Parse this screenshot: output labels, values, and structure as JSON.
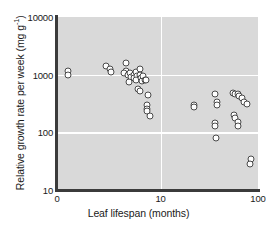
{
  "chart_data": {
    "type": "scatter",
    "title": "",
    "xlabel": "Leaf lifespan (months)",
    "ylabel_text": "Relative growth rate per week (mg g",
    "ylabel_sup": "-1",
    "ylabel_tail": ")",
    "ylabel_full": "Relative growth rate per week (mg g^-1)",
    "xscale": "log-like",
    "yscale": "log",
    "xlim": [
      0,
      100
    ],
    "ylim": [
      10,
      10000
    ],
    "xticks": [
      0,
      10,
      100
    ],
    "xtick_labels": [
      "0",
      "10",
      "100"
    ],
    "yticks": [
      10,
      100,
      1000,
      10000
    ],
    "ytick_labels": [
      "10",
      "100",
      "1000",
      "10000"
    ],
    "grid": true,
    "grid_color": "#ffffff",
    "plot_background": "#d9d9d9",
    "marker_style": "open-circle",
    "marker_edge_color": "#4a4a4a",
    "legend": null,
    "points": [
      {
        "x": 0.3,
        "y": 1150
      },
      {
        "x": 0.3,
        "y": 1000
      },
      {
        "x": 2.1,
        "y": 1400
      },
      {
        "x": 2.4,
        "y": 1250
      },
      {
        "x": 2.5,
        "y": 1100
      },
      {
        "x": 3.9,
        "y": 1600
      },
      {
        "x": 4.0,
        "y": 1150
      },
      {
        "x": 3.7,
        "y": 1050
      },
      {
        "x": 4.2,
        "y": 980
      },
      {
        "x": 4.4,
        "y": 1080
      },
      {
        "x": 4.6,
        "y": 900
      },
      {
        "x": 4.3,
        "y": 760
      },
      {
        "x": 4.9,
        "y": 1000
      },
      {
        "x": 5.2,
        "y": 1120
      },
      {
        "x": 5.0,
        "y": 880
      },
      {
        "x": 5.4,
        "y": 960
      },
      {
        "x": 5.3,
        "y": 820
      },
      {
        "x": 5.8,
        "y": 1250
      },
      {
        "x": 5.9,
        "y": 1000
      },
      {
        "x": 6.0,
        "y": 870
      },
      {
        "x": 6.2,
        "y": 780
      },
      {
        "x": 6.4,
        "y": 950
      },
      {
        "x": 6.6,
        "y": 820
      },
      {
        "x": 6.9,
        "y": 800
      },
      {
        "x": 5.6,
        "y": 560
      },
      {
        "x": 5.9,
        "y": 520
      },
      {
        "x": 7.3,
        "y": 450
      },
      {
        "x": 7.1,
        "y": 300
      },
      {
        "x": 7.0,
        "y": 250
      },
      {
        "x": 7.1,
        "y": 230
      },
      {
        "x": 7.6,
        "y": 190
      },
      {
        "x": 22,
        "y": 300
      },
      {
        "x": 22,
        "y": 270
      },
      {
        "x": 36,
        "y": 470
      },
      {
        "x": 38,
        "y": 330
      },
      {
        "x": 38,
        "y": 300
      },
      {
        "x": 36,
        "y": 145
      },
      {
        "x": 36,
        "y": 130
      },
      {
        "x": 37,
        "y": 80
      },
      {
        "x": 56,
        "y": 480
      },
      {
        "x": 58,
        "y": 460
      },
      {
        "x": 62,
        "y": 470
      },
      {
        "x": 64,
        "y": 430
      },
      {
        "x": 68,
        "y": 390
      },
      {
        "x": 72,
        "y": 330
      },
      {
        "x": 78,
        "y": 310
      },
      {
        "x": 57,
        "y": 200
      },
      {
        "x": 58,
        "y": 175
      },
      {
        "x": 62,
        "y": 150
      },
      {
        "x": 63,
        "y": 130
      },
      {
        "x": 84,
        "y": 35
      },
      {
        "x": 83,
        "y": 28
      }
    ]
  }
}
